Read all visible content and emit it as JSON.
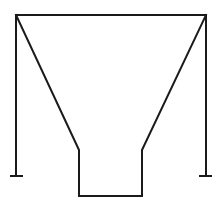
{
  "diagram": {
    "type": "line-drawing",
    "stroke_color": "#1a1a1a",
    "background_color": "#ffffff",
    "stroke_width": 2,
    "top_rim": {
      "x1": 16,
      "y1": 15,
      "x2": 206,
      "y2": 15
    },
    "left_post": {
      "x": 16,
      "y1": 15,
      "y2": 176,
      "foot_x1": 11,
      "foot_x2": 22
    },
    "right_post": {
      "x": 206,
      "y1": 15,
      "y2": 176,
      "foot_x1": 200,
      "foot_x2": 211
    },
    "funnel_outline_points": "16,15 79,150 79,196 142,196 142,150 206,15"
  }
}
